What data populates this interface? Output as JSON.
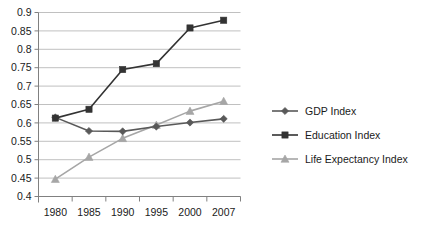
{
  "chart_data": {
    "type": "line",
    "title": "",
    "xlabel": "",
    "ylabel": "",
    "categories": [
      "1980",
      "1985",
      "1990",
      "1995",
      "2000",
      "2007"
    ],
    "ylim": [
      0.4,
      0.9
    ],
    "ytick_labels": [
      "0.9",
      "0.85",
      "0.8",
      "0.75",
      "0.7",
      "0.65",
      "0.6",
      "0.55",
      "0.5",
      "0.45",
      "0.4"
    ],
    "ytick_values": [
      0.9,
      0.85,
      0.8,
      0.75,
      0.7,
      0.65,
      0.6,
      0.55,
      0.5,
      0.45,
      0.4
    ],
    "grid": true,
    "legend_position": "right",
    "series": [
      {
        "name": "GDP Index",
        "marker": "diamond",
        "color": "#595959",
        "values": [
          0.615,
          0.578,
          0.577,
          0.59,
          0.601,
          0.611
        ]
      },
      {
        "name": "Education Index",
        "marker": "square",
        "color": "#333333",
        "values": [
          0.613,
          0.637,
          0.745,
          0.761,
          0.858,
          0.879
        ]
      },
      {
        "name": "Life Expectancy Index",
        "marker": "triangle",
        "color": "#a6a6a6",
        "values": [
          0.447,
          0.507,
          0.558,
          0.594,
          0.632,
          0.659
        ]
      }
    ]
  },
  "legend": {
    "items": [
      {
        "label": "GDP Index"
      },
      {
        "label": "Education Index"
      },
      {
        "label": "Life Expectancy Index"
      }
    ]
  },
  "axes": {
    "x_labels": [
      "1980",
      "1985",
      "1990",
      "1995",
      "2000",
      "2007"
    ],
    "y_labels": [
      "0.9",
      "0.85",
      "0.8",
      "0.75",
      "0.7",
      "0.65",
      "0.6",
      "0.55",
      "0.5",
      "0.45",
      "0.4"
    ]
  }
}
